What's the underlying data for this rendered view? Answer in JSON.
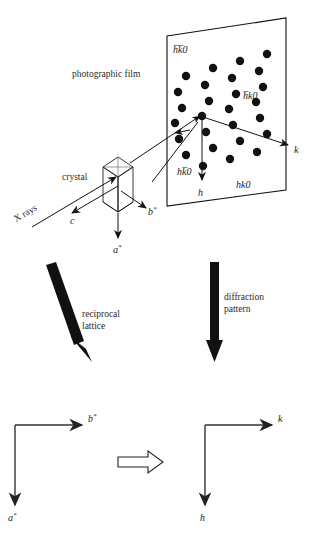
{
  "figure": {
    "colors": {
      "ink": "#111111",
      "spot": "#111111",
      "background": "#ffffff"
    }
  },
  "labels": {
    "photographic_film": "photographic film",
    "crystal": "crystal",
    "x_rays": "X rays",
    "axis_c": "c",
    "axis_b_star": "b",
    "axis_b_star_sup": "*",
    "axis_a_star": "a",
    "axis_a_star_sup": "*",
    "film_top_left": "h̅k̅0",
    "film_right": "h̅k0",
    "film_bottom_left": "hk̅0",
    "film_bottom_right": "hk0",
    "film_axis_h": "h",
    "film_axis_k": "k",
    "reciprocal_lattice_line1": "reciprocal",
    "reciprocal_lattice_line2": "lattice",
    "diffraction_pattern_line1": "diffraction",
    "diffraction_pattern_line2": "pattern",
    "bottom_left_axis_horizontal": "b",
    "bottom_left_axis_horizontal_sup": "*",
    "bottom_left_axis_vertical": "a",
    "bottom_left_axis_vertical_sup": "*",
    "bottom_right_axis_horizontal": "k",
    "bottom_right_axis_vertical": "h"
  },
  "chart_data": {
    "type": "scatter",
    "xlabel": "k",
    "ylabel": "h",
    "quadrant_labels": [
      "h̅k̅0",
      "h̅k0",
      "hk̅0",
      "hk0"
    ],
    "spot_radius_px": 4.2,
    "spots": [
      {
        "x": 186,
        "y": 76
      },
      {
        "x": 213,
        "y": 68
      },
      {
        "x": 240,
        "y": 61
      },
      {
        "x": 267,
        "y": 54
      },
      {
        "x": 178,
        "y": 92
      },
      {
        "x": 205,
        "y": 85
      },
      {
        "x": 232,
        "y": 78
      },
      {
        "x": 259,
        "y": 71
      },
      {
        "x": 182,
        "y": 108
      },
      {
        "x": 209,
        "y": 101
      },
      {
        "x": 236,
        "y": 94
      },
      {
        "x": 263,
        "y": 87
      },
      {
        "x": 175,
        "y": 123
      },
      {
        "x": 202,
        "y": 116
      },
      {
        "x": 229,
        "y": 109
      },
      {
        "x": 256,
        "y": 102
      },
      {
        "x": 179,
        "y": 139
      },
      {
        "x": 206,
        "y": 132
      },
      {
        "x": 233,
        "y": 125
      },
      {
        "x": 260,
        "y": 118
      },
      {
        "x": 186,
        "y": 155
      },
      {
        "x": 213,
        "y": 148
      },
      {
        "x": 240,
        "y": 141
      },
      {
        "x": 267,
        "y": 134
      },
      {
        "x": 203,
        "y": 166
      },
      {
        "x": 230,
        "y": 159
      },
      {
        "x": 257,
        "y": 152
      }
    ],
    "center_spot": {
      "x": 202,
      "y": 116
    },
    "origin_index": "000"
  }
}
